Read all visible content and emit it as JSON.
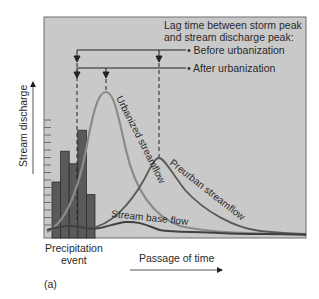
{
  "figure": {
    "panel_label": "(a)",
    "legend": {
      "title_line1": "Lag time between storm peak",
      "title_line2": "and stream discharge peak:",
      "before": "• Before urbanization",
      "after": "• After urbanization"
    },
    "y_axis_label": "Stream discharge",
    "x_axis_label": "Passage of time",
    "precipitation_label_line1": "Precipitation",
    "precipitation_label_line2": "event",
    "curve_labels": {
      "urbanized": "Urbanized streamflow",
      "preurban": "Preurban streamflow",
      "base": "Stream base flow"
    }
  },
  "chart_data": {
    "type": "bar+line",
    "title": "",
    "xlabel": "Passage of time",
    "ylabel": "Stream discharge",
    "precipitation_bars": [
      0.4,
      0.62,
      0.53,
      0.77,
      0.31
    ],
    "series": [
      {
        "name": "Urbanized streamflow",
        "peak_time_fraction": 0.24,
        "peak_value": 0.87
      },
      {
        "name": "Preurban streamflow",
        "peak_time_fraction": 0.44,
        "peak_value": 0.36
      },
      {
        "name": "Stream base flow",
        "level": 0.05
      }
    ],
    "annotations": [
      "Before urbanization",
      "After urbanization"
    ]
  }
}
